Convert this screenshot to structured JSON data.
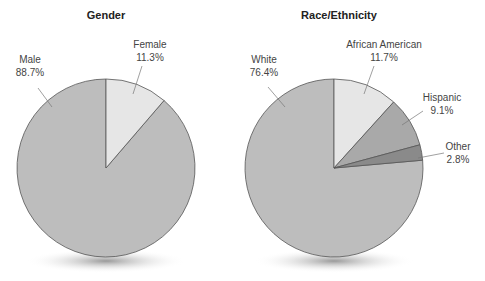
{
  "chart_data": [
    {
      "type": "pie",
      "title": "Gender",
      "categories": [
        "Male",
        "Female"
      ],
      "values": [
        88.7,
        11.3
      ],
      "labels": [
        "88.7%",
        "11.3%"
      ],
      "colors": [
        "#bdbdbd",
        "#e6e6e6"
      ],
      "legend": "none (callout labels)"
    },
    {
      "type": "pie",
      "title": "Race/Ethnicity",
      "categories": [
        "White",
        "African American",
        "Hispanic",
        "Other"
      ],
      "values": [
        76.4,
        11.7,
        9.1,
        2.8
      ],
      "labels": [
        "76.4%",
        "11.7%",
        "9.1%",
        "2.8%"
      ],
      "colors": [
        "#bdbdbd",
        "#e6e6e6",
        "#a9a9a9",
        "#8a8a8a"
      ],
      "legend": "none (callout labels)"
    }
  ],
  "charts": {
    "gender": {
      "title": "Gender",
      "male": {
        "name": "Male",
        "pct": "88.7%"
      },
      "female": {
        "name": "Female",
        "pct": "11.3%"
      }
    },
    "race": {
      "title": "Race/Ethnicity",
      "white": {
        "name": "White",
        "pct": "76.4%"
      },
      "aa": {
        "name": "African American",
        "pct": "11.7%"
      },
      "hispanic": {
        "name": "Hispanic",
        "pct": "9.1%"
      },
      "other": {
        "name": "Other",
        "pct": "2.8%"
      }
    }
  }
}
